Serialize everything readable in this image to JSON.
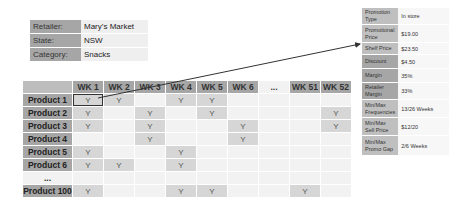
{
  "info": {
    "rows": [
      {
        "label": "Retailer:",
        "value": "Mary’s Market"
      },
      {
        "label": "State:",
        "value": "NSW"
      },
      {
        "label": "Category:",
        "value": "Snacks"
      }
    ]
  },
  "grid": {
    "columns": [
      "WK 1",
      "WK 2",
      "WK 3",
      "WK 4",
      "WK 5",
      "WK 6",
      "...",
      "WK 51",
      "WK 52"
    ],
    "rows": [
      {
        "label": "Product 1",
        "cells": [
          "Y",
          "Y",
          "",
          "Y",
          "Y",
          "",
          "",
          "",
          ""
        ]
      },
      {
        "label": "Product 2",
        "cells": [
          "Y",
          "",
          "Y",
          "",
          "Y",
          "",
          "",
          "",
          "Y"
        ]
      },
      {
        "label": "Product 3",
        "cells": [
          "Y",
          "",
          "Y",
          "",
          "",
          "Y",
          "",
          "",
          "Y"
        ]
      },
      {
        "label": "Product 4",
        "cells": [
          "",
          "",
          "Y",
          "",
          "",
          "Y",
          "",
          "",
          ""
        ]
      },
      {
        "label": "Product 5",
        "cells": [
          "Y",
          "",
          "",
          "Y",
          "",
          "",
          "",
          "",
          ""
        ]
      },
      {
        "label": "Product 6",
        "cells": [
          "Y",
          "Y",
          "",
          "Y",
          "",
          "",
          "",
          "",
          ""
        ]
      },
      {
        "label": "...",
        "cells": [
          "",
          "",
          "",
          "",
          "",
          "",
          "",
          "",
          ""
        ]
      },
      {
        "label": "Product 100",
        "cells": [
          "Y",
          "",
          "",
          "Y",
          "Y",
          "",
          "",
          "Y",
          ""
        ]
      }
    ]
  },
  "promo": {
    "rows": [
      {
        "label": "Promotion Type",
        "value": "In store"
      },
      {
        "label": "Promotional Price",
        "value": "$19.00"
      },
      {
        "label": "Shelf Price",
        "value": "$23.50"
      },
      {
        "label": "Discount",
        "value": "$4.50"
      },
      {
        "label": "Margin",
        "value": "35%"
      },
      {
        "label": "Retailer Margin",
        "value": "33%"
      },
      {
        "label": "Min/Max Frequencies",
        "value": "13/26 Weeks"
      },
      {
        "label": "Min/Max Sell Price",
        "value": "$12/20"
      },
      {
        "label": "Min/Max Promo Gap",
        "value": "2/6 Weeks"
      }
    ]
  }
}
